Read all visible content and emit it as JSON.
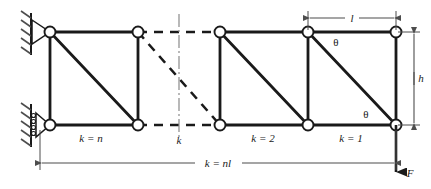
{
  "figure": {
    "type": "cantilever-truss-diagram",
    "colors": {
      "member": "#1a1a1a",
      "node_fill": "#ffffff",
      "node_stroke": "#1a1a1a",
      "dimension": "#4d4d4d",
      "centerline": "#7a7a7a",
      "hatch": "#4d4d4d",
      "background": "#ffffff"
    },
    "geometry": {
      "top_chord_y": 32,
      "bottom_chord_y": 125,
      "node_x": [
        50,
        138,
        220,
        308,
        396
      ],
      "node_radius": 5.5,
      "member_width": 2.6,
      "panel_height": 93,
      "panel_width": 88
    }
  },
  "labels": {
    "panel_n": "k = n",
    "panel_middle": "k",
    "panel_2": "k = 2",
    "panel_1": "k = 1",
    "span": "k = nl",
    "length": "l",
    "height": "h",
    "theta_upper": "θ",
    "theta_lower": "θ",
    "force": "F"
  },
  "supports": {
    "upper": {
      "kind": "pin-support",
      "x": 50,
      "y": 32
    },
    "lower": {
      "kind": "roller-support",
      "x": 50,
      "y": 125
    }
  },
  "load": {
    "symbol": "F",
    "direction": "down",
    "applied_at_x": 396,
    "applied_at_y": 125
  },
  "dimensions": [
    {
      "name": "length",
      "label": "l",
      "orientation": "horizontal",
      "from_x": 308,
      "to_x": 396,
      "y": 18
    },
    {
      "name": "height",
      "label": "h",
      "orientation": "vertical",
      "x": 414,
      "from_y": 32,
      "to_y": 125
    },
    {
      "name": "span",
      "label": "k = nl",
      "orientation": "horizontal",
      "from_x": 40,
      "to_x": 396,
      "y": 163
    }
  ]
}
